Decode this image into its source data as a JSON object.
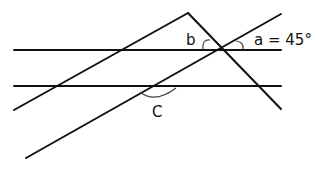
{
  "diagram": {
    "labels": {
      "a": "a = 45°",
      "b": "b",
      "c": "C"
    },
    "lines": {
      "parallel_top": {
        "x1": 14,
        "y1": 50,
        "x2": 281,
        "y2": 50
      },
      "parallel_bottom": {
        "x1": 14,
        "y1": 86,
        "x2": 281,
        "y2": 86
      },
      "left_rising": {
        "x1": 14,
        "y1": 110,
        "x2": 188,
        "y2": 13
      },
      "apex_descending": {
        "x1": 188,
        "y1": 13,
        "x2": 281,
        "y2": 109
      },
      "long_diagonal": {
        "x1": 26,
        "y1": 158,
        "x2": 281,
        "y2": 14
      }
    },
    "colors": {
      "line": "#111111",
      "arc": "#444444",
      "background": "#ffffff"
    }
  }
}
